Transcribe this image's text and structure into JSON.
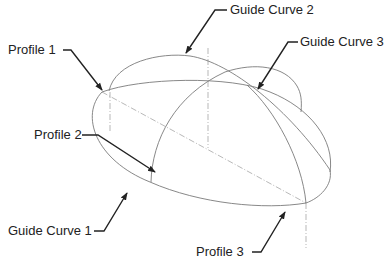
{
  "diagram": {
    "type": "loft-with-guide-curves",
    "colors": {
      "curve": "#7a7a7a",
      "centerline": "#9a9a9a",
      "leader": "#222222",
      "text": "#222222",
      "background": "#ffffff"
    },
    "labels": {
      "profile_1": "Profile 1",
      "profile_2": "Profile 2",
      "profile_3": "Profile 3",
      "guide_curve_1": "Guide Curve 1",
      "guide_curve_2": "Guide Curve 2",
      "guide_curve_3": "Guide Curve 3"
    }
  }
}
